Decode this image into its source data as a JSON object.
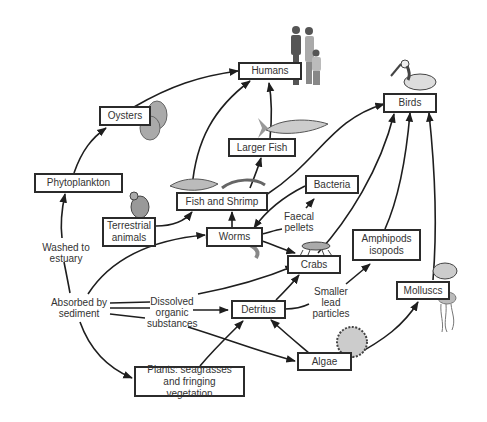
{
  "diagram": {
    "type": "food-web",
    "nodes": {
      "humans": "Humans",
      "oysters": "Oysters",
      "birds": "Birds",
      "larger_fish": "Larger Fish",
      "phytoplankton": "Phytoplankton",
      "bacteria": "Bacteria",
      "fish_shrimp": "Fish and Shrimp",
      "terrestrial": "Terrestrial animals",
      "worms": "Worms",
      "crabs": "Crabs",
      "amphipods": "Amphipods isopods",
      "molluscs": "Molluscs",
      "detritus": "Detritus",
      "algae": "Algae",
      "plants": "Plants: seagrasses and fringing vegetation"
    },
    "labels": {
      "washed": "Washed to estuary",
      "absorbed": "Absorbed by sediment",
      "dissolved": "Dissolved organic substances",
      "faecal": "Faecal pellets",
      "smaller": "Smaller lead particles"
    },
    "edges": [
      {
        "from": "Phytoplankton",
        "to": "Oysters"
      },
      {
        "from": "Oysters",
        "to": "Humans"
      },
      {
        "from": "Fish and Shrimp",
        "to": "Humans"
      },
      {
        "from": "Larger Fish",
        "to": "Humans"
      },
      {
        "from": "Fish and Shrimp",
        "to": "Larger Fish"
      },
      {
        "from": "Fish and Shrimp",
        "to": "Birds"
      },
      {
        "from": "Crabs",
        "to": "Birds"
      },
      {
        "from": "Amphipods isopods",
        "to": "Birds"
      },
      {
        "from": "Molluscs",
        "to": "Birds"
      },
      {
        "from": "Terrestrial animals",
        "to": "Fish and Shrimp"
      },
      {
        "from": "Worms",
        "to": "Fish and Shrimp"
      },
      {
        "from": "Bacteria",
        "to": "Worms"
      },
      {
        "from": "Faecal pellets",
        "to": "Bacteria"
      },
      {
        "from": "Worms",
        "to": "Crabs"
      },
      {
        "from": "Detritus",
        "to": "Crabs"
      },
      {
        "from": "Dissolved organic substances",
        "to": "Crabs"
      },
      {
        "from": "Dissolved organic substances",
        "to": "Detritus"
      },
      {
        "from": "Dissolved organic substances",
        "to": "Algae"
      },
      {
        "from": "Absorbed by sediment",
        "to": "Worms"
      },
      {
        "from": "Absorbed by sediment",
        "to": "Plants: seagrasses and fringing vegetation"
      },
      {
        "from": "Washed to estuary",
        "to": "Phytoplankton"
      },
      {
        "from": "Plants: seagrasses and fringing vegetation",
        "to": "Detritus"
      },
      {
        "from": "Algae",
        "to": "Detritus"
      },
      {
        "from": "Algae",
        "to": "Molluscs"
      },
      {
        "from": "Smaller lead particles",
        "to": "Amphipods isopods"
      }
    ]
  }
}
